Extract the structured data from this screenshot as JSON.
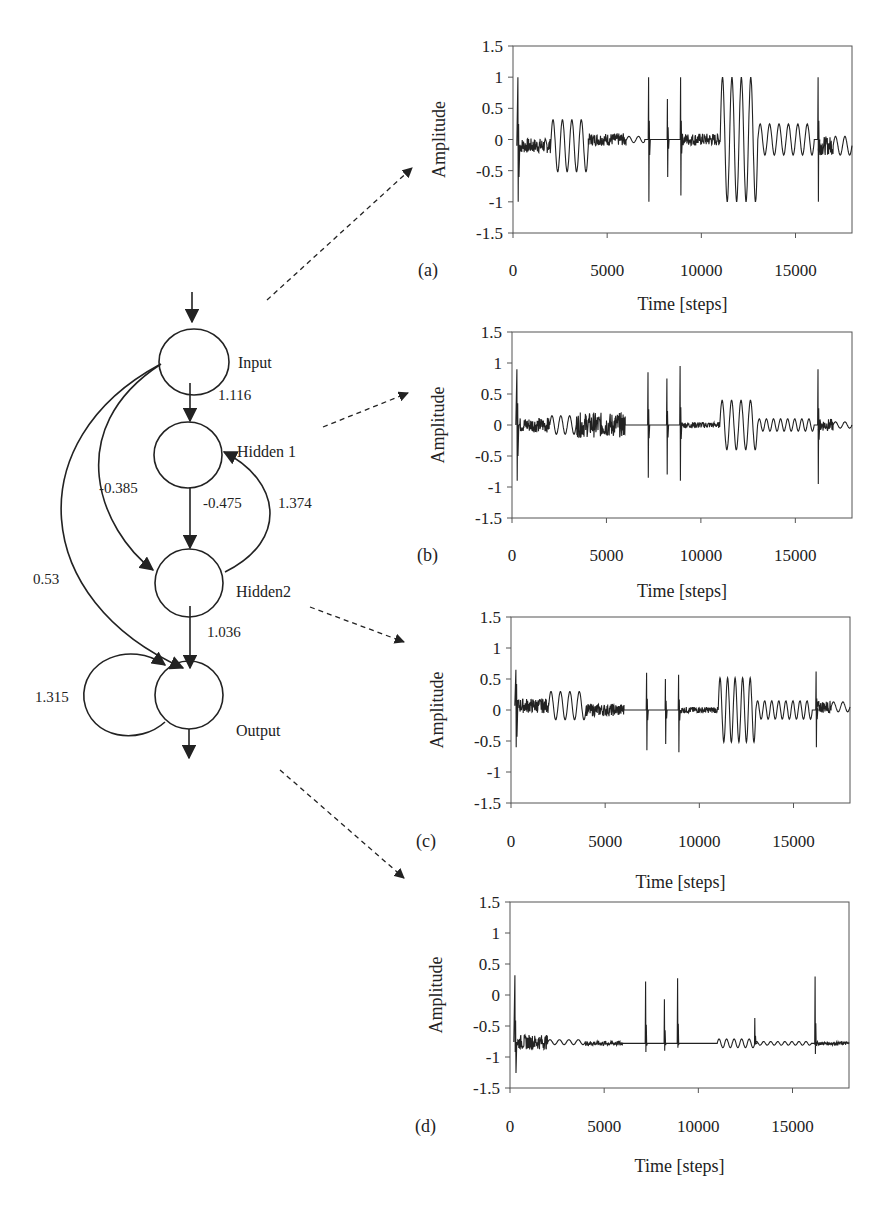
{
  "network": {
    "nodes": [
      {
        "id": "input",
        "label": "Input"
      },
      {
        "id": "hidden1",
        "label": "Hidden 1"
      },
      {
        "id": "hidden2",
        "label": "Hidden2"
      },
      {
        "id": "output",
        "label": "Output"
      }
    ],
    "edges": [
      {
        "from": "input",
        "to": "hidden1",
        "weight": "1.116"
      },
      {
        "from": "input",
        "to": "hidden2",
        "weight": "-0.385"
      },
      {
        "from": "input",
        "to": "output",
        "weight": "0.53"
      },
      {
        "from": "hidden1",
        "to": "hidden2",
        "weight": "-0.475"
      },
      {
        "from": "hidden2",
        "to": "hidden1",
        "weight": "1.374"
      },
      {
        "from": "hidden2",
        "to": "output",
        "weight": "1.036"
      },
      {
        "from": "output",
        "to": "output",
        "weight": "1.315"
      }
    ]
  },
  "chart_data": [
    {
      "type": "line",
      "panel": "(a)",
      "source_node": "Input",
      "xlabel": "Time [steps]",
      "ylabel": "Amplitude",
      "xlim": [
        0,
        18000
      ],
      "ylim": [
        -1.5,
        1.5
      ],
      "xticks": [
        "0",
        "5000",
        "10000",
        "15000"
      ],
      "yticks": [
        "1.5",
        "1",
        "0.5",
        "0",
        "-0.5",
        "-1",
        "-1.5"
      ],
      "segments": [
        {
          "x": [
            0,
            2000
          ],
          "kind": "noise+spike",
          "baseline": -0.1,
          "spike_max": 1.0,
          "spike_min": -1.0
        },
        {
          "x": [
            2000,
            4000
          ],
          "kind": "sine",
          "amplitude": 0.42,
          "cycles": 4
        },
        {
          "x": [
            4000,
            6000
          ],
          "kind": "noise",
          "baseline": 0.0,
          "spread": 0.1
        },
        {
          "x": [
            6000,
            7000
          ],
          "kind": "small-wave",
          "amplitude": 0.05
        },
        {
          "x": [
            7200,
            7200
          ],
          "kind": "spike",
          "max": 1.0,
          "min": -1.0
        },
        {
          "x": [
            8200,
            8200
          ],
          "kind": "spike",
          "max": 0.65,
          "min": -0.6
        },
        {
          "x": [
            8900,
            8900
          ],
          "kind": "spike",
          "max": 1.0,
          "min": -0.9
        },
        {
          "x": [
            9000,
            11000
          ],
          "kind": "noise",
          "baseline": 0.0,
          "spread": 0.1
        },
        {
          "x": [
            11000,
            13000
          ],
          "kind": "sine",
          "amplitude": 1.0,
          "cycles": 4
        },
        {
          "x": [
            13000,
            16000
          ],
          "kind": "sine",
          "amplitude": 0.25,
          "cycles": 6
        },
        {
          "x": [
            16200,
            16200
          ],
          "kind": "spike",
          "max": 1.0,
          "min": -1.0
        },
        {
          "x": [
            16200,
            17000
          ],
          "kind": "noise",
          "baseline": -0.1,
          "spread": 0.15
        },
        {
          "x": [
            17000,
            18000
          ],
          "kind": "sine",
          "amplitude": 0.15,
          "cycles": 2
        }
      ]
    },
    {
      "type": "line",
      "panel": "(b)",
      "source_node": "Hidden 1",
      "xlabel": "Time [steps]",
      "ylabel": "Amplitude",
      "xlim": [
        0,
        18000
      ],
      "ylim": [
        -1.5,
        1.5
      ],
      "xticks": [
        "0",
        "5000",
        "10000",
        "15000"
      ],
      "yticks": [
        "1.5",
        "1",
        "0.5",
        "0",
        "-0.5",
        "-1",
        "-1.5"
      ],
      "segments": [
        {
          "x": [
            0,
            2000
          ],
          "kind": "noise+spike",
          "baseline": 0.0,
          "spike_max": 0.9,
          "spike_min": -0.9
        },
        {
          "x": [
            2000,
            3400
          ],
          "kind": "sine",
          "amplitude": 0.15,
          "cycles": 3
        },
        {
          "x": [
            3400,
            6000
          ],
          "kind": "noise",
          "baseline": 0.0,
          "spread": 0.2
        },
        {
          "x": [
            7200,
            7200
          ],
          "kind": "spike",
          "max": 0.85,
          "min": -0.85
        },
        {
          "x": [
            8200,
            8200
          ],
          "kind": "spike",
          "max": 0.75,
          "min": -0.8
        },
        {
          "x": [
            8900,
            8900
          ],
          "kind": "spike",
          "max": 0.95,
          "min": -0.9
        },
        {
          "x": [
            9000,
            11000
          ],
          "kind": "noise",
          "baseline": 0.0,
          "spread": 0.05
        },
        {
          "x": [
            11000,
            13000
          ],
          "kind": "sine",
          "amplitude": 0.4,
          "cycles": 4
        },
        {
          "x": [
            13000,
            16000
          ],
          "kind": "sine",
          "amplitude": 0.1,
          "cycles": 8
        },
        {
          "x": [
            16200,
            16200
          ],
          "kind": "spike",
          "max": 0.9,
          "min": -0.95
        },
        {
          "x": [
            16200,
            17000
          ],
          "kind": "noise",
          "baseline": 0.0,
          "spread": 0.1
        },
        {
          "x": [
            17000,
            18000
          ],
          "kind": "sine",
          "amplitude": 0.05,
          "cycles": 2
        }
      ]
    },
    {
      "type": "line",
      "panel": "(c)",
      "source_node": "Hidden2",
      "xlabel": "Time [steps]",
      "ylabel": "Amplitude",
      "xlim": [
        0,
        18000
      ],
      "ylim": [
        -1.5,
        1.5
      ],
      "xticks": [
        "0",
        "5000",
        "10000",
        "15000"
      ],
      "yticks": [
        "1.5",
        "1",
        "0.5",
        "0",
        "-0.5",
        "-1",
        "-1.5"
      ],
      "segments": [
        {
          "x": [
            0,
            2000
          ],
          "kind": "noise+spike",
          "baseline": 0.07,
          "spike_max": 0.65,
          "spike_min": -0.6
        },
        {
          "x": [
            2000,
            4000
          ],
          "kind": "sine",
          "amplitude": 0.23,
          "cycles": 4
        },
        {
          "x": [
            4000,
            6000
          ],
          "kind": "noise",
          "baseline": 0.0,
          "spread": 0.1
        },
        {
          "x": [
            7200,
            7200
          ],
          "kind": "spike",
          "max": 0.6,
          "min": -0.65
        },
        {
          "x": [
            8200,
            8200
          ],
          "kind": "spike",
          "max": 0.5,
          "min": -0.55
        },
        {
          "x": [
            8900,
            8900
          ],
          "kind": "spike",
          "max": 0.57,
          "min": -0.68
        },
        {
          "x": [
            9000,
            11000
          ],
          "kind": "noise",
          "baseline": 0.0,
          "spread": 0.05
        },
        {
          "x": [
            11000,
            13000
          ],
          "kind": "sine",
          "amplitude": 0.52,
          "cycles": 5
        },
        {
          "x": [
            13000,
            16000
          ],
          "kind": "sine",
          "amplitude": 0.15,
          "cycles": 8
        },
        {
          "x": [
            16200,
            16200
          ],
          "kind": "spike",
          "max": 0.62,
          "min": -0.6
        },
        {
          "x": [
            16200,
            17000
          ],
          "kind": "noise",
          "baseline": 0.05,
          "spread": 0.1
        },
        {
          "x": [
            17000,
            18000
          ],
          "kind": "sine",
          "amplitude": 0.08,
          "cycles": 2
        }
      ]
    },
    {
      "type": "line",
      "panel": "(d)",
      "source_node": "Output",
      "xlabel": "Time [steps]",
      "ylabel": "Amplitude",
      "xlim": [
        0,
        18000
      ],
      "ylim": [
        -1.5,
        1.5
      ],
      "xticks": [
        "0",
        "5000",
        "10000",
        "15000"
      ],
      "yticks": [
        "1.5",
        "1",
        "0.5",
        "0",
        "-0.5",
        "-1",
        "-1.5"
      ],
      "segments": [
        {
          "x": [
            0,
            2000
          ],
          "kind": "noise+spike",
          "baseline": -0.76,
          "spike_max": 0.32,
          "spike_min": -0.92
        },
        {
          "x": [
            2000,
            4000
          ],
          "kind": "sine",
          "amplitude": 0.04,
          "cycles": 4
        },
        {
          "x": [
            4000,
            6000
          ],
          "kind": "noise",
          "baseline": -0.78,
          "spread": 0.04
        },
        {
          "x": [
            7200,
            7200
          ],
          "kind": "spike",
          "max": 0.22,
          "min": -0.92
        },
        {
          "x": [
            8200,
            8200
          ],
          "kind": "spike",
          "max": -0.07,
          "min": -0.9
        },
        {
          "x": [
            8900,
            8900
          ],
          "kind": "spike",
          "max": 0.27,
          "min": -0.85
        },
        {
          "x": [
            9000,
            11000
          ],
          "kind": "flat",
          "baseline": -0.78
        },
        {
          "x": [
            11000,
            13000
          ],
          "kind": "sine",
          "amplitude": 0.07,
          "cycles": 5
        },
        {
          "x": [
            13000,
            13000
          ],
          "kind": "spike",
          "max": -0.37,
          "min": -0.8
        },
        {
          "x": [
            13000,
            16000
          ],
          "kind": "sine",
          "amplitude": 0.03,
          "cycles": 8
        },
        {
          "x": [
            16200,
            16200
          ],
          "kind": "spike",
          "max": 0.3,
          "min": -0.95
        },
        {
          "x": [
            16200,
            18000
          ],
          "kind": "noise",
          "baseline": -0.78,
          "spread": 0.03
        }
      ]
    }
  ]
}
